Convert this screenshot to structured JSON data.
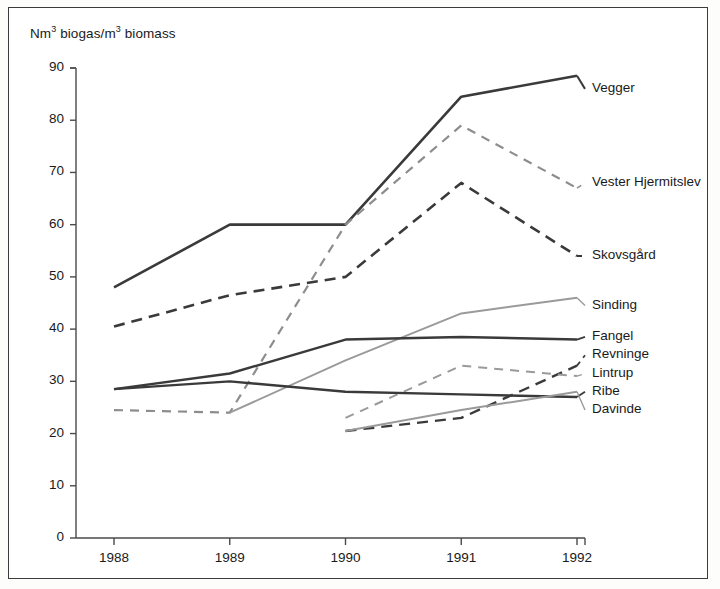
{
  "chart_data": {
    "type": "line",
    "title": "",
    "ylabel": "Nm3 biogas/m3 biomass",
    "ylabel_parts": {
      "prefix": "Nm",
      "sup1": "3",
      "mid": " biogas/m",
      "sup2": "3",
      "suffix": " biomass"
    },
    "xlabel": "",
    "x": [
      1988,
      1989,
      1990,
      1991,
      1992
    ],
    "xtick_labels": [
      "1988",
      "1989",
      "1990",
      "1991",
      "1992"
    ],
    "ytick_labels": [
      "0",
      "10",
      "20",
      "30",
      "40",
      "50",
      "60",
      "70",
      "80",
      "90"
    ],
    "ytick_values": [
      0,
      10,
      20,
      30,
      40,
      50,
      60,
      70,
      80,
      90
    ],
    "ylim": [
      0,
      90
    ],
    "xlim": [
      1988,
      1992
    ],
    "grid": false,
    "legend_position": "right-inline-labels",
    "series": [
      {
        "name": "Vegger",
        "style": "solid",
        "color": "#3a3a3a",
        "width": 2.6,
        "x": [
          1988,
          1989,
          1990,
          1991,
          1992
        ],
        "values": [
          48,
          60,
          60,
          84.5,
          88.5
        ],
        "label_y_value": 86
      },
      {
        "name": "Vester Hjermitslev",
        "style": "dashed",
        "color": "#8d8d8d",
        "width": 2.2,
        "x": [
          1988,
          1989,
          1990,
          1991,
          1992
        ],
        "values": [
          24.5,
          24,
          60,
          79,
          67
        ],
        "label_y_value": 68
      },
      {
        "name": "Skovsgård",
        "style": "dashed",
        "color": "#3a3a3a",
        "width": 2.6,
        "x": [
          1988,
          1989,
          1990,
          1991,
          1992
        ],
        "values": [
          40.5,
          46.5,
          50,
          68,
          54
        ],
        "label_y_value": 54
      },
      {
        "name": "Sinding",
        "style": "solid",
        "color": "#9a9a9a",
        "width": 2.0,
        "x": [
          1989,
          1990,
          1991,
          1992
        ],
        "values": [
          24,
          34,
          43,
          46
        ],
        "label_y_value": 44.5
      },
      {
        "name": "Fangel",
        "style": "solid",
        "color": "#3a3a3a",
        "width": 2.4,
        "x": [
          1988,
          1989,
          1990,
          1991,
          1992
        ],
        "values": [
          28.5,
          31.5,
          38,
          38.5,
          38
        ],
        "label_y_value": 38.5
      },
      {
        "name": "Revninge",
        "style": "dashed",
        "color": "#3a3a3a",
        "width": 2.4,
        "x": [
          1990,
          1991,
          1992
        ],
        "values": [
          20.5,
          23,
          33
        ],
        "label_y_value": 35
      },
      {
        "name": "Lintrup",
        "style": "dashed",
        "color": "#9a9a9a",
        "width": 2.0,
        "x": [
          1990,
          1991,
          1992
        ],
        "values": [
          23,
          33,
          31
        ],
        "label_y_value": 31.5
      },
      {
        "name": "Ribe",
        "style": "solid",
        "color": "#3a3a3a",
        "width": 2.4,
        "x": [
          1988,
          1989,
          1990,
          1991,
          1992
        ],
        "values": [
          28.5,
          30,
          28,
          27.5,
          27
        ],
        "label_y_value": 28
      },
      {
        "name": "Davinde",
        "style": "solid",
        "color": "#9a9a9a",
        "width": 2.0,
        "x": [
          1990,
          1991,
          1992
        ],
        "values": [
          20.5,
          24.5,
          28
        ],
        "label_y_value": 24.5
      }
    ]
  },
  "axis": {
    "y_title": "Nm biogas/m biomass"
  }
}
